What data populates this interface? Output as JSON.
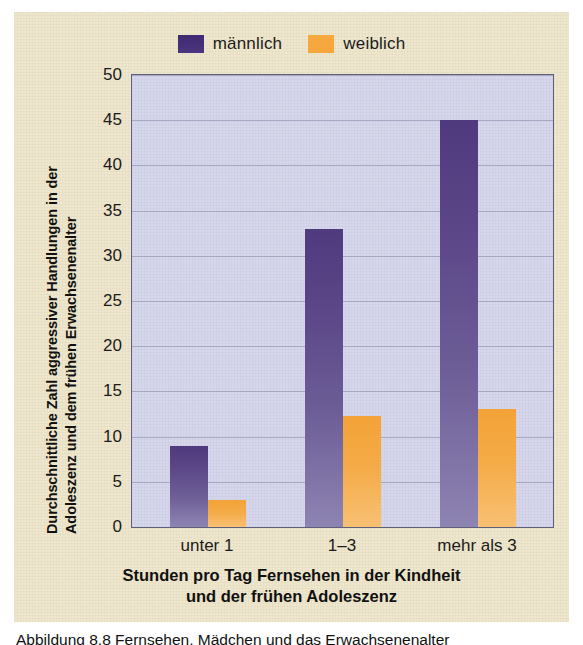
{
  "figure": {
    "background_color": "#efe7cd",
    "caption": "Abbildung 8.8 Fernsehen, Mädchen und das Erwachsenenalter"
  },
  "legend": {
    "position": "top-center",
    "entries": [
      {
        "label": "männlich",
        "color": "#4b3580",
        "key": "male"
      },
      {
        "label": "weiblich",
        "color": "#f5a63c",
        "key": "female"
      }
    ]
  },
  "axes": {
    "ytitle_line1": "Durchschnittliche Zahl aggressiver Handlungen in der",
    "ytitle_line2": "Adoleszenz und dem frühen Erwachsenenalter",
    "xtitle_line1": "Stunden pro Tag Fernsehen in der Kindheit",
    "xtitle_line2": "und der frühen Adoleszenz",
    "yticks": [
      "50",
      "45",
      "40",
      "35",
      "30",
      "25",
      "20",
      "15",
      "10",
      "5",
      "0"
    ]
  },
  "chart_data": {
    "type": "bar",
    "title": "",
    "subtitle": "",
    "categories": [
      "unter 1",
      "1–3",
      "mehr als 3"
    ],
    "series": [
      {
        "name": "männlich",
        "color": "#4b3580",
        "values": [
          9,
          33,
          45
        ]
      },
      {
        "name": "weiblich",
        "color": "#f5a63c",
        "values": [
          3,
          12.3,
          13.1
        ]
      }
    ],
    "xlabel": "Stunden pro Tag Fernsehen in der Kindheit und der frühen Adoleszenz",
    "ylabel": "Durchschnittliche Zahl aggressiver Handlungen in der Adoleszenz und dem frühen Erwachsenenalter",
    "ylim": [
      0,
      50
    ],
    "ytick_step": 5,
    "grid": true,
    "grid_axis": "y",
    "legend_position": "top-center",
    "plot_background": "#d6d7ea"
  }
}
